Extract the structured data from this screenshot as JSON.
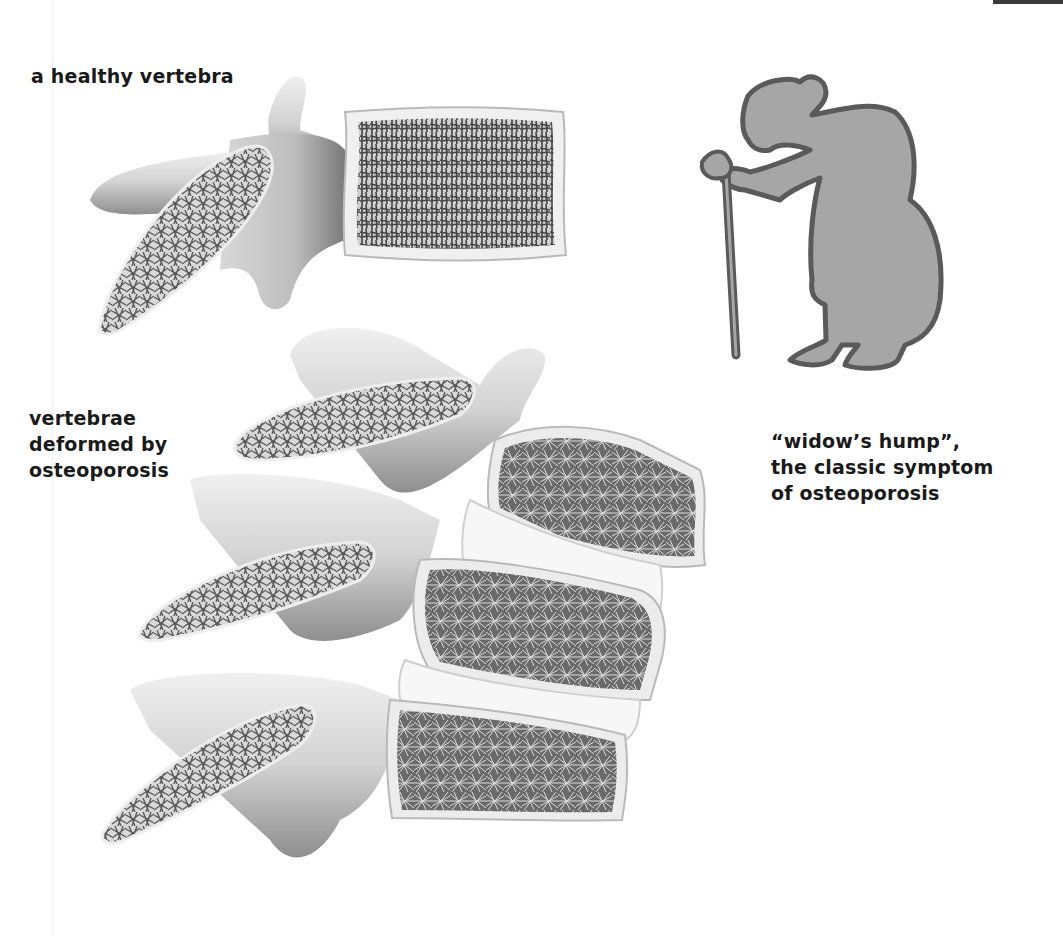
{
  "labels": {
    "healthy": "a healthy vertebra",
    "deformed": [
      "vertebrae",
      "deformed by",
      "osteoporosis"
    ],
    "hump": [
      "“widow’s hump”,",
      "the classic symptom",
      "of osteoporosis"
    ]
  },
  "figures": {
    "healthy_vertebra": "single healthy vertebra with dense trabecular bone",
    "deformed_vertebrae": "stack of three vertebrae with wedge-deformed porous bodies",
    "silhouette": "stooped elderly woman with cane"
  },
  "colors": {
    "bone_light": "#e6e6e6",
    "bone_mid": "#c4c4c4",
    "bone_dark": "#8a8a8a",
    "trabecular": "#555555",
    "disc": "#f4f4f4",
    "silhouette_fill": "#a6a6a6",
    "silhouette_stroke": "#5a5a5a",
    "text": "#1a1a1a"
  }
}
